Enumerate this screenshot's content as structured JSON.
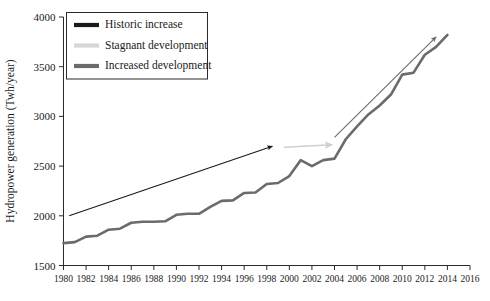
{
  "chart_data": {
    "type": "line",
    "title": "",
    "xlabel": "",
    "ylabel": "Hydropower generation (Twh/year)",
    "xlim": [
      1980,
      2016
    ],
    "ylim": [
      1500,
      4000
    ],
    "grid": false,
    "legend_position": "top-left",
    "x_ticks": [
      1980,
      1982,
      1984,
      1986,
      1988,
      1990,
      1992,
      1994,
      1996,
      1998,
      2000,
      2002,
      2004,
      2006,
      2008,
      2010,
      2012,
      2014,
      2016
    ],
    "y_ticks": [
      1500,
      2000,
      2500,
      3000,
      3500,
      4000
    ],
    "series": [
      {
        "name": "Increased development",
        "color": "#6b6b6b",
        "type": "line",
        "x": [
          1980,
          1981,
          1982,
          1983,
          1984,
          1985,
          1986,
          1987,
          1988,
          1989,
          1990,
          1991,
          1992,
          1993,
          1994,
          1995,
          1996,
          1997,
          1998,
          1999,
          2000,
          2001,
          2002,
          2003,
          2004,
          2005,
          2006,
          2007,
          2008,
          2009,
          2010,
          2011,
          2012,
          2013,
          2014
        ],
        "values": [
          1725,
          1735,
          1790,
          1800,
          1860,
          1870,
          1930,
          1940,
          1940,
          1945,
          2010,
          2020,
          2020,
          2090,
          2150,
          2155,
          2230,
          2235,
          2320,
          2330,
          2400,
          2560,
          2500,
          2560,
          2575,
          2770,
          2900,
          3020,
          3110,
          3220,
          3420,
          3440,
          3620,
          3700,
          3820
        ]
      }
    ],
    "annotations": [
      {
        "name": "Historic increase",
        "color": "#1a1a1a",
        "type": "arrow",
        "from": {
          "x": 1980.5,
          "y": 2000
        },
        "to": {
          "x": 1998.5,
          "y": 2700
        }
      },
      {
        "name": "Stagnant development",
        "color": "#cfcfcf",
        "type": "arrow",
        "from": {
          "x": 1999.5,
          "y": 2690
        },
        "to": {
          "x": 2003.8,
          "y": 2715
        }
      },
      {
        "name": "Increased development",
        "color": "#6b6b6b",
        "type": "arrow",
        "from": {
          "x": 2004.0,
          "y": 2790
        },
        "to": {
          "x": 2013.0,
          "y": 3800
        }
      }
    ]
  },
  "legend": {
    "items": [
      {
        "label": "Historic increase",
        "color": "#1a1a1a",
        "thickness": 4
      },
      {
        "label": "Stagnant development",
        "color": "#d0d0d0",
        "thickness": 4
      },
      {
        "label": "Increased development",
        "color": "#6b6b6b",
        "thickness": 4
      }
    ]
  },
  "axes": {
    "y_label": "Hydropower generation (Twh/year)",
    "y_tick_labels": [
      "1500",
      "2000",
      "2500",
      "3000",
      "3500",
      "4000"
    ],
    "x_tick_labels": [
      "1980",
      "1982",
      "1984",
      "1986",
      "1988",
      "1990",
      "1992",
      "1994",
      "1996",
      "1998",
      "2000",
      "2002",
      "2004",
      "2006",
      "2008",
      "2010",
      "2012",
      "2014",
      "2016"
    ]
  }
}
